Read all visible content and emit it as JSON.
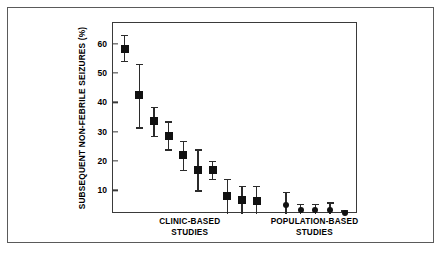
{
  "figure": {
    "border_color": "#5a5a5a",
    "background": "#ffffff",
    "marker_color": "#111111"
  },
  "chart_data": {
    "type": "scatter",
    "title": "",
    "subtitle": "",
    "xlabel": "",
    "ylabel": "SUBSEQUENT NON-FEBRILE SEIZURES (%)",
    "ylim": [
      2,
      67
    ],
    "yticks": [
      10,
      20,
      30,
      40,
      50,
      60
    ],
    "ytick_labels": [
      "10",
      "20",
      "30",
      "40",
      "50",
      "60"
    ],
    "grid": false,
    "legend": null,
    "error_bars": "vertical, capped",
    "groups": [
      {
        "name": "CLINIC-BASED STUDIES",
        "label_line1": "CLINIC-BASED",
        "label_line2": "STUDIES",
        "marker": "square",
        "n_points": 10
      },
      {
        "name": "POPULATION-BASED STUDIES",
        "label_line1": "POPULATION-BASED",
        "label_line2": "STUDIES",
        "marker": "circle",
        "n_points": 5
      }
    ],
    "points": [
      {
        "group": "CLINIC-BASED STUDIES",
        "x": 1,
        "y": 58.0,
        "y_low": 54.0,
        "y_high": 63.0
      },
      {
        "group": "CLINIC-BASED STUDIES",
        "x": 2,
        "y": 42.5,
        "y_low": 31.5,
        "y_high": 53.0
      },
      {
        "group": "CLINIC-BASED STUDIES",
        "x": 3,
        "y": 33.5,
        "y_low": 28.5,
        "y_high": 38.5
      },
      {
        "group": "CLINIC-BASED STUDIES",
        "x": 4,
        "y": 28.5,
        "y_low": 24.0,
        "y_high": 33.5
      },
      {
        "group": "CLINIC-BASED STUDIES",
        "x": 5,
        "y": 22.0,
        "y_low": 17.0,
        "y_high": 27.0
      },
      {
        "group": "CLINIC-BASED STUDIES",
        "x": 6,
        "y": 17.0,
        "y_low": 10.0,
        "y_high": 24.0
      },
      {
        "group": "CLINIC-BASED STUDIES",
        "x": 7,
        "y": 17.0,
        "y_low": 14.0,
        "y_high": 20.0
      },
      {
        "group": "CLINIC-BASED STUDIES",
        "x": 8,
        "y": 8.0,
        "y_low": 2.0,
        "y_high": 14.0
      },
      {
        "group": "CLINIC-BASED STUDIES",
        "x": 9,
        "y": 6.8,
        "y_low": 2.0,
        "y_high": 11.5
      },
      {
        "group": "CLINIC-BASED STUDIES",
        "x": 10,
        "y": 6.5,
        "y_low": 2.0,
        "y_high": 11.5
      },
      {
        "group": "POPULATION-BASED STUDIES",
        "x": 12,
        "y": 5.0,
        "y_low": 2.0,
        "y_high": 9.5
      },
      {
        "group": "POPULATION-BASED STUDIES",
        "x": 13,
        "y": 3.5,
        "y_low": 2.0,
        "y_high": 5.5
      },
      {
        "group": "POPULATION-BASED STUDIES",
        "x": 14,
        "y": 3.5,
        "y_low": 2.0,
        "y_high": 5.5
      },
      {
        "group": "POPULATION-BASED STUDIES",
        "x": 15,
        "y": 3.5,
        "y_low": 2.0,
        "y_high": 6.0
      },
      {
        "group": "POPULATION-BASED STUDIES",
        "x": 16,
        "y": 2.3,
        "y_low": 2.0,
        "y_high": 3.2
      }
    ]
  }
}
